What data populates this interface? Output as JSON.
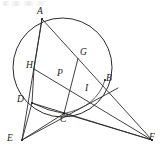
{
  "figure": {
    "background_color": "#ffffff",
    "stroke_color": "#2b2b2b",
    "label_color": "#1a1a1a",
    "width": 162,
    "height": 162
  },
  "circle": {
    "name": "circumcircle",
    "cx": 62.5,
    "cy": 67.5,
    "r": 49.5
  },
  "points": [
    {
      "id": "A",
      "label": "A",
      "x": 42.0,
      "y": 19.0,
      "label_x": 38.0,
      "label_y": 8.0,
      "on_circle": true
    },
    {
      "id": "G",
      "label": "G",
      "x": 78.0,
      "y": 58.5,
      "label_x": 80.0,
      "label_y": 49.0,
      "on_circle": false
    },
    {
      "id": "B",
      "label": "B",
      "x": 105.0,
      "y": 80.0,
      "label_x": 106.0,
      "label_y": 75.0,
      "on_circle": true
    },
    {
      "id": "H",
      "label": "H",
      "x": 37.0,
      "y": 70.5,
      "label_x": 27.0,
      "label_y": 62.0,
      "on_circle": false
    },
    {
      "id": "P",
      "label": "P",
      "x": 64.0,
      "y": 80.0,
      "label_x": 58.0,
      "label_y": 70.0,
      "on_circle": false
    },
    {
      "id": "I",
      "label": "I",
      "x": 89.0,
      "y": 94.5,
      "label_x": 85.0,
      "label_y": 85.0,
      "on_circle": false
    },
    {
      "id": "D",
      "label": "D",
      "x": 32.0,
      "y": 103.0,
      "label_x": 18.0,
      "label_y": 96.0,
      "on_circle": true
    },
    {
      "id": "C",
      "label": "C",
      "x": 64.0,
      "y": 113.5,
      "label_x": 60.0,
      "label_y": 114.0,
      "on_circle": true
    },
    {
      "id": "E",
      "label": "E",
      "x": 22.0,
      "y": 140.0,
      "label_x": 8.0,
      "label_y": 135.0,
      "on_circle": false
    },
    {
      "id": "F",
      "label": "F",
      "x": 152.0,
      "y": 140.0,
      "label_x": 150.0,
      "label_y": 134.0,
      "on_circle": false
    }
  ],
  "segments": [
    {
      "name": "chord-A-D-extended-to-E",
      "from": "A",
      "to": "E"
    },
    {
      "name": "line-A-G-B-extended-to-F",
      "from": "A",
      "to": "F"
    },
    {
      "name": "line-H-P-I-extended-to-F",
      "from": "H",
      "to": "F"
    },
    {
      "name": "segment-A-H",
      "from": "A",
      "to": "H"
    },
    {
      "name": "chord-D-C",
      "from": "D",
      "to": "C"
    },
    {
      "name": "line-E-to-B",
      "from": "E",
      "to": "B"
    },
    {
      "name": "line-E-to-C",
      "from": "E",
      "to": "C"
    },
    {
      "name": "line-E-to-D",
      "from": "E",
      "to": "D"
    },
    {
      "name": "line-F-to-C",
      "from": "F",
      "to": "C"
    },
    {
      "name": "line-F-to-D",
      "from": "F",
      "to": "D"
    },
    {
      "name": "segment-C-G",
      "from": "C",
      "to": "G"
    },
    {
      "name": "segment-H-D",
      "from": "H",
      "to": "D"
    }
  ],
  "scan_artifact": {
    "name": "top-left-scan-speckle",
    "present": true
  }
}
